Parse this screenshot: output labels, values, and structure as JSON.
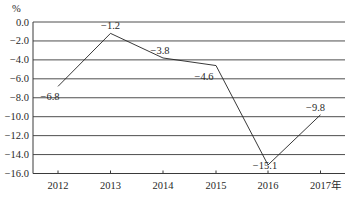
{
  "chart_data": {
    "type": "line",
    "title": "",
    "xlabel": "",
    "ylabel": "%",
    "categories": [
      "2012",
      "2013",
      "2014",
      "2015",
      "2016",
      "2017年"
    ],
    "series": [
      {
        "name": "growth",
        "values": [
          -6.8,
          -1.2,
          -3.8,
          -4.6,
          -15.1,
          -9.8
        ]
      }
    ],
    "data_labels": [
      "-6.8",
      "-1.2",
      "-3.8",
      "-4.6",
      "-15.1",
      "-9.8"
    ],
    "yticks": [
      0.0,
      -2.0,
      -4.0,
      -6.0,
      -8.0,
      -10.0,
      -12.0,
      -14.0,
      -16.0
    ],
    "ytick_labels": [
      "0.0",
      "-2.0",
      "-4.0",
      "-6.0",
      "-8.0",
      "-10.0",
      "-12.0",
      "-14.0",
      "-16.0"
    ],
    "ylim": [
      -16.0,
      0.0
    ],
    "grid": true,
    "legend": "none"
  }
}
